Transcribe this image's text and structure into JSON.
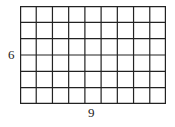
{
  "diagram": {
    "type": "grid-rectangle",
    "columns": 9,
    "rows": 6,
    "line_color": "#222222",
    "labels": {
      "height": "6",
      "width": "9"
    }
  }
}
